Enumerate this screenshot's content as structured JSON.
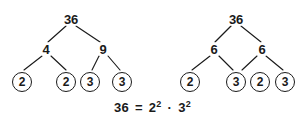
{
  "figure": {
    "background_color": "#ffffff",
    "ink_color": "#1a1a1a"
  },
  "trees": [
    {
      "name": "left-factor-tree",
      "root": "36",
      "level2": [
        "4",
        "9"
      ],
      "leaves": [
        "2",
        "2",
        "3",
        "3"
      ]
    },
    {
      "name": "right-factor-tree",
      "root": "36",
      "level2": [
        "6",
        "6"
      ],
      "leaves": [
        "2",
        "3",
        "2",
        "3"
      ]
    }
  ],
  "equation": {
    "left": "36",
    "equals": "=",
    "base1": "2",
    "exp1": "2",
    "operator": "·",
    "base2": "3",
    "exp2": "2",
    "full_text": "36 = 2² · 3²"
  }
}
